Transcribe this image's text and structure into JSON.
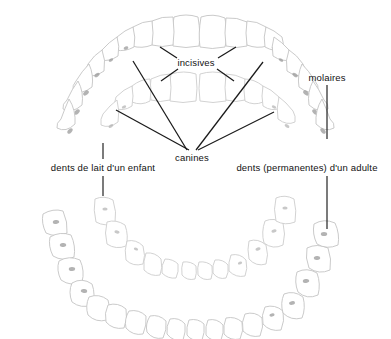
{
  "figure": {
    "language": "fr",
    "background_color": "#ffffff",
    "line_color": "#1a1a1a",
    "tooth_outline_color": "#c9c9c9",
    "cusp_color": "#9a9a9a"
  },
  "labels": {
    "incisives": "incisives",
    "canines": "canines",
    "molaires": "molaires",
    "dents_de_lait": "dents de lait d'un enfant",
    "dents_permanentes": "dents (permanentes) d'un adulte"
  },
  "label_positions": {
    "incisives": {
      "x": 196,
      "y": 63,
      "align": "center"
    },
    "canines": {
      "x": 192,
      "y": 158,
      "align": "center"
    },
    "molaires": {
      "x": 327,
      "y": 78,
      "align": "center"
    },
    "dents_de_lait": {
      "x": 103,
      "y": 168,
      "align": "center"
    },
    "dents_permanentes": {
      "x": 307,
      "y": 168,
      "align": "center"
    }
  },
  "leader_lines": {
    "incisives": [
      {
        "x1": 177,
        "y1": 58,
        "x2": 160,
        "y2": 47
      },
      {
        "x1": 178,
        "y1": 69,
        "x2": 161,
        "y2": 81
      },
      {
        "x1": 218,
        "y1": 58,
        "x2": 236,
        "y2": 47
      },
      {
        "x1": 217,
        "y1": 69,
        "x2": 234,
        "y2": 81
      }
    ],
    "canines": [
      {
        "x1": 187,
        "y1": 150,
        "x2": 133,
        "y2": 61
      },
      {
        "x1": 189,
        "y1": 150,
        "x2": 116,
        "y2": 110
      },
      {
        "x1": 196,
        "y1": 150,
        "x2": 263,
        "y2": 62
      },
      {
        "x1": 198,
        "y1": 150,
        "x2": 274,
        "y2": 112
      }
    ],
    "molaires_tick": [
      {
        "x1": 327,
        "y1": 85,
        "x2": 327,
        "y2": 139
      }
    ],
    "dents_de_lait_tick": [
      {
        "x1": 103,
        "y1": 143,
        "x2": 103,
        "y2": 159
      },
      {
        "x1": 103,
        "y1": 176,
        "x2": 103,
        "y2": 196
      }
    ],
    "dents_permanentes_tick": [
      {
        "x1": 327,
        "y1": 176,
        "x2": 327,
        "y2": 229
      }
    ]
  },
  "arches": {
    "upper": {
      "name": "mâchoire supérieure",
      "adult_teeth_count": 16,
      "baby_teeth_count": 10
    },
    "lower": {
      "name": "mâchoire inférieure",
      "adult_teeth_count": 16,
      "baby_teeth_count": 10
    }
  },
  "tooth_types": [
    "incisives",
    "canines",
    "prémolaires",
    "molaires"
  ]
}
